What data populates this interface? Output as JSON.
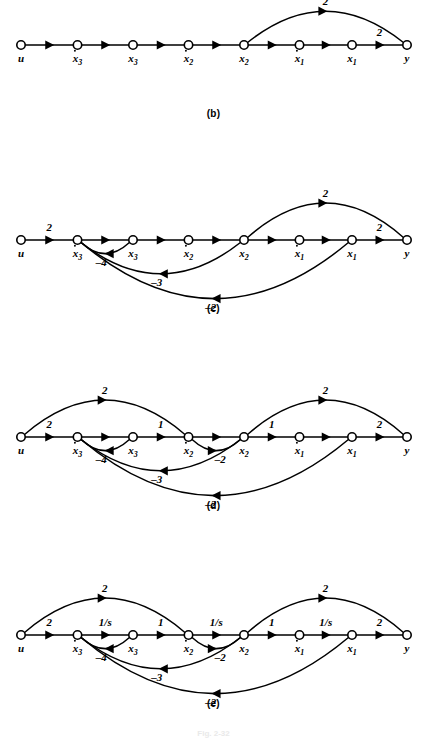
{
  "figure": {
    "caption": "Fig. 2-32",
    "node_labels": {
      "u": {
        "base": "u",
        "sub": "",
        "dot": false
      },
      "dx3": {
        "base": "x",
        "sub": "3",
        "dot": true
      },
      "x3": {
        "base": "x",
        "sub": "3",
        "dot": false
      },
      "dx2": {
        "base": "x",
        "sub": "2",
        "dot": true
      },
      "x2": {
        "base": "x",
        "sub": "2",
        "dot": false
      },
      "dx1": {
        "base": "x",
        "sub": "1",
        "dot": true
      },
      "x1": {
        "base": "x",
        "sub": "1",
        "dot": false
      },
      "y": {
        "base": "y",
        "sub": "",
        "dot": false
      }
    },
    "node_order": [
      "u",
      "dx3",
      "x3",
      "dx2",
      "x2",
      "dx1",
      "x1",
      "y"
    ],
    "panels": [
      {
        "id": "b",
        "caption": "(b)",
        "chain_weights": [
          "",
          "",
          "",
          "",
          "",
          "",
          "2"
        ],
        "arcs": [
          {
            "from": "x2",
            "to": "y",
            "weight": "2",
            "side": "top",
            "height": 42
          }
        ]
      },
      {
        "id": "c",
        "caption": "(c)",
        "chain_weights": [
          "2",
          "",
          "",
          "",
          "",
          "",
          "2"
        ],
        "arcs": [
          {
            "from": "x2",
            "to": "y",
            "weight": "2",
            "side": "top",
            "height": 46
          },
          {
            "from": "x3",
            "to": "dx3",
            "weight": "–4",
            "side": "bottom",
            "height": 16
          },
          {
            "from": "x2",
            "to": "dx3",
            "weight": "–3",
            "side": "bottom",
            "height": 42
          },
          {
            "from": "x1",
            "to": "dx3",
            "weight": "–2",
            "side": "bottom",
            "height": 74
          }
        ]
      },
      {
        "id": "d",
        "caption": "(d)",
        "chain_weights": [
          "2",
          "",
          "1",
          "",
          "1",
          "",
          "2"
        ],
        "arcs": [
          {
            "from": "u",
            "to": "dx2",
            "weight": "2",
            "side": "top",
            "height": 46
          },
          {
            "from": "x2",
            "to": "y",
            "weight": "2",
            "side": "top",
            "height": 46
          },
          {
            "from": "x3",
            "to": "dx3",
            "weight": "–4",
            "side": "bottom",
            "height": 16
          },
          {
            "from": "dx2",
            "to": "x2",
            "weight": "–2",
            "side": "bottom",
            "height": 16
          },
          {
            "from": "x2",
            "to": "dx3",
            "weight": "–3",
            "side": "bottom",
            "height": 42
          },
          {
            "from": "x1",
            "to": "dx3",
            "weight": "–2",
            "side": "bottom",
            "height": 74
          }
        ]
      },
      {
        "id": "e",
        "caption": "(e)",
        "chain_weights": [
          "2",
          "1/s",
          "1",
          "1/s",
          "1",
          "1/s",
          "2"
        ],
        "arcs": [
          {
            "from": "u",
            "to": "dx2",
            "weight": "2",
            "side": "top",
            "height": 46
          },
          {
            "from": "x2",
            "to": "y",
            "weight": "2",
            "side": "top",
            "height": 46
          },
          {
            "from": "x3",
            "to": "dx3",
            "weight": "–4",
            "side": "bottom",
            "height": 16
          },
          {
            "from": "dx2",
            "to": "x2",
            "weight": "–2",
            "side": "bottom",
            "height": 16
          },
          {
            "from": "x2",
            "to": "dx3",
            "weight": "–3",
            "side": "bottom",
            "height": 42
          },
          {
            "from": "x1",
            "to": "dx3",
            "weight": "–2",
            "side": "bottom",
            "height": 74
          }
        ]
      }
    ]
  }
}
